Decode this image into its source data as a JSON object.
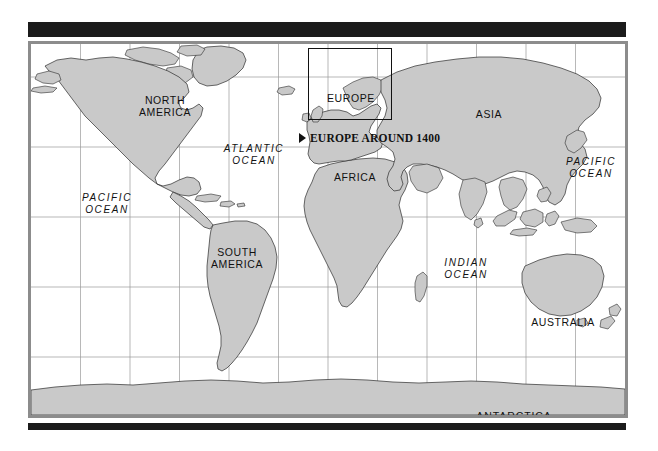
{
  "map": {
    "title": "World Map",
    "frame": {
      "width": 600,
      "height": 377
    },
    "colors": {
      "land": "#c9c9c9",
      "land_outline": "#2b2b2b",
      "ocean": "#ffffff",
      "graticule": "#9a9a9a",
      "frame_border": "#8c8c8c",
      "rule_bar": "#1b1b1b",
      "label_text": "#111111"
    },
    "graticule": {
      "visible": true,
      "vertical_lines": 11,
      "horizontal_lines": 5
    }
  },
  "callout": {
    "marker": "right-triangle-marker",
    "text": "EUROPE AROUND 1400"
  },
  "inset_box": {
    "name": "europe-detail-box",
    "region": "EUROPE"
  },
  "labels": {
    "continents": [
      {
        "id": "north-america",
        "text": "NORTH\nAMERICA"
      },
      {
        "id": "south-america",
        "text": "SOUTH\nAMERICA"
      },
      {
        "id": "europe",
        "text": "EUROPE"
      },
      {
        "id": "africa",
        "text": "AFRICA"
      },
      {
        "id": "asia",
        "text": "ASIA"
      },
      {
        "id": "australia",
        "text": "AUSTRALIA"
      },
      {
        "id": "antarctica",
        "text": "ANTARCTICA"
      }
    ],
    "oceans": [
      {
        "id": "pacific-ocean-west",
        "text": "PACIFIC\nOCEAN"
      },
      {
        "id": "atlantic-ocean",
        "text": "ATLANTIC\nOCEAN"
      },
      {
        "id": "indian-ocean",
        "text": "INDIAN\nOCEAN"
      },
      {
        "id": "pacific-ocean-east",
        "text": "PACIFIC\nOCEAN"
      }
    ]
  }
}
